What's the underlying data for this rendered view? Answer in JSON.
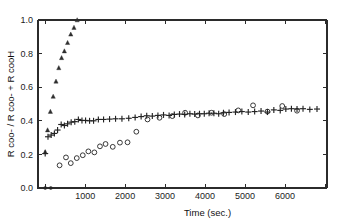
{
  "chart_data": {
    "type": "scatter",
    "title": "",
    "xlabel": "Time (sec.)",
    "ylabel": "R coo- / R coo- + R cooH",
    "xlim": [
      -180,
      7050
    ],
    "ylim": [
      0.0,
      1.0
    ],
    "xticks": [
      0,
      1000,
      2000,
      3000,
      4000,
      5000,
      6000,
      7000
    ],
    "xticklabels": [
      "",
      "1000",
      "2000",
      "3000",
      "4000",
      "5000",
      "6000",
      ""
    ],
    "yticks": [
      0.0,
      0.2,
      0.4,
      0.6,
      0.8,
      1.0
    ],
    "yticklabels": [
      "0.0",
      "0.2",
      "0.4",
      "0.6",
      "0.8",
      "1.0"
    ],
    "grid": false,
    "legend": "none",
    "marker_color": "#232323",
    "axis_color": "#2b2b2b",
    "series": [
      {
        "name": "triangle-series",
        "marker": "triangle",
        "x": [
          0,
          60,
          130,
          200,
          270,
          340,
          410,
          480,
          560,
          640,
          720,
          800
        ],
        "y": [
          0.215,
          0.345,
          0.455,
          0.545,
          0.635,
          0.715,
          0.775,
          0.815,
          0.865,
          0.915,
          0.955,
          1.0
        ]
      },
      {
        "name": "plus-series",
        "marker": "plus",
        "x": [
          0,
          70,
          150,
          230,
          310,
          400,
          480,
          560,
          650,
          740,
          830,
          920,
          1010,
          1110,
          1210,
          1330,
          1460,
          1610,
          1760,
          1920,
          2090,
          2250,
          2400,
          2540,
          2680,
          2820,
          2960,
          3100,
          3230,
          3360,
          3490,
          3620,
          3740,
          3860,
          3980,
          4100,
          4220,
          4340,
          4460,
          4600,
          4760,
          4920,
          5080,
          5240,
          5400,
          5560,
          5720,
          5880,
          6020,
          6160,
          6300,
          6450,
          6620,
          6800
        ],
        "y": [
          0.205,
          0.305,
          0.315,
          0.325,
          0.345,
          0.378,
          0.372,
          0.382,
          0.392,
          0.395,
          0.408,
          0.402,
          0.402,
          0.4,
          0.4,
          0.408,
          0.408,
          0.41,
          0.412,
          0.412,
          0.415,
          0.42,
          0.425,
          0.43,
          0.428,
          0.432,
          0.435,
          0.432,
          0.438,
          0.44,
          0.438,
          0.442,
          0.44,
          0.442,
          0.442,
          0.445,
          0.445,
          0.442,
          0.448,
          0.45,
          0.452,
          0.455,
          0.452,
          0.455,
          0.458,
          0.452,
          0.465,
          0.462,
          0.47,
          0.472,
          0.47,
          0.472,
          0.468,
          0.47
        ]
      },
      {
        "name": "open-circle-series",
        "marker": "circle",
        "x": [
          360,
          520,
          640,
          790,
          940,
          1080,
          1230,
          1370,
          1510,
          1690,
          1870,
          2060,
          2280,
          2560,
          2860,
          3180,
          3500,
          3820,
          4160,
          4480,
          4830,
          5200,
          5560,
          5930,
          6300
        ],
        "y": [
          0.135,
          0.182,
          0.148,
          0.178,
          0.195,
          0.218,
          0.212,
          0.248,
          0.262,
          0.245,
          0.27,
          0.272,
          0.335,
          0.408,
          0.418,
          0.428,
          0.448,
          0.432,
          0.448,
          0.44,
          0.462,
          0.492,
          0.455,
          0.488,
          0.46
        ]
      },
      {
        "name": "origin-point-series",
        "marker": "circle-filled",
        "x": [
          0,
          140
        ],
        "y": [
          0.0,
          0.0
        ]
      }
    ]
  }
}
